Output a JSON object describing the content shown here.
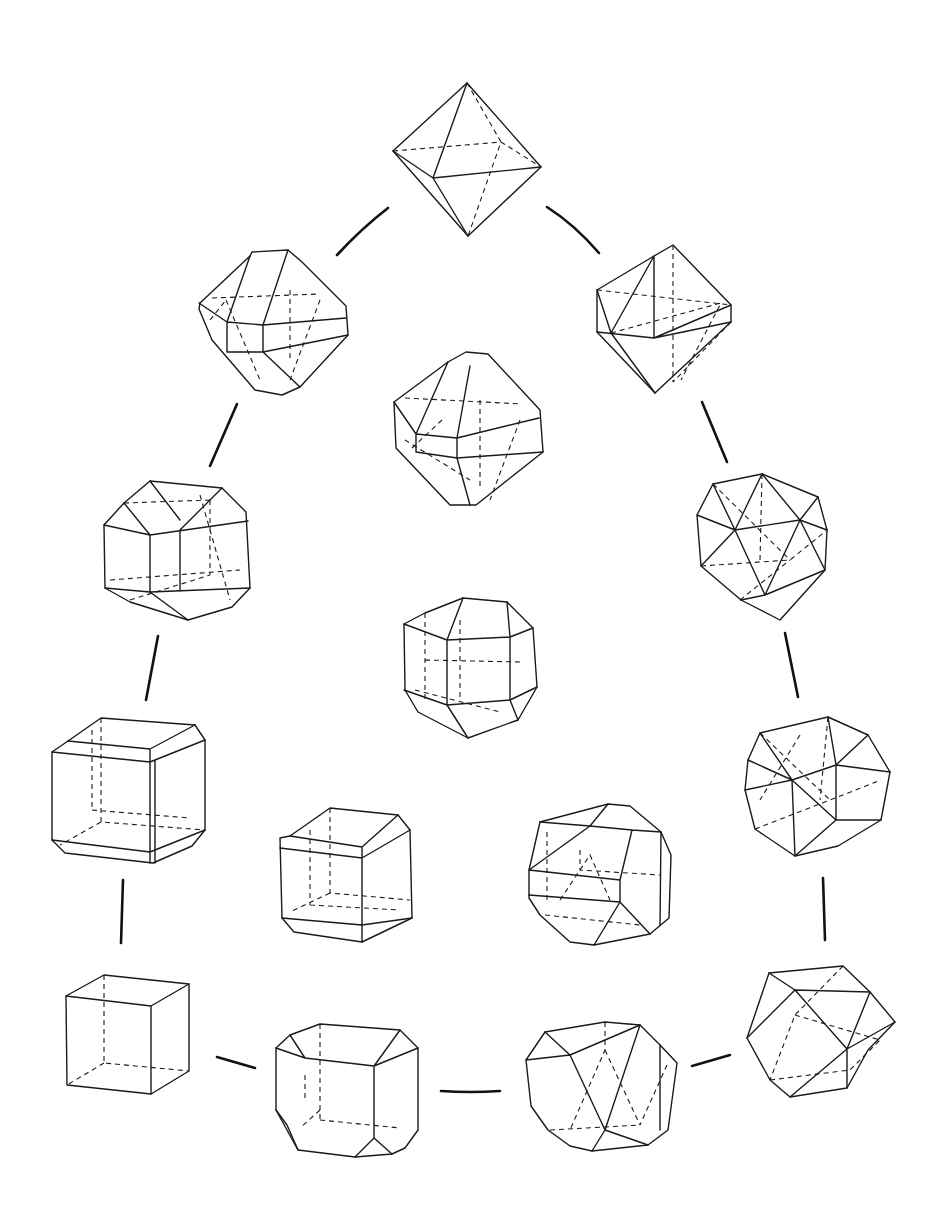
{
  "figure": {
    "background": "#ffffff",
    "line_color": "#1a1a1a",
    "shapes": [
      {
        "id": "octahedron",
        "cx": 467,
        "cy": 160
      },
      {
        "id": "truncated-octahedron-left",
        "cx": 273,
        "cy": 320
      },
      {
        "id": "octahedron-with-cube-faces-right",
        "cx": 663,
        "cy": 320
      },
      {
        "id": "center-upper-form",
        "cx": 468,
        "cy": 428
      },
      {
        "id": "cubo-octahedral-left",
        "cx": 176,
        "cy": 548
      },
      {
        "id": "icosahedral-right",
        "cx": 762,
        "cy": 546
      },
      {
        "id": "center-middle-form",
        "cx": 470,
        "cy": 666
      },
      {
        "id": "chamfered-cube-left",
        "cx": 127,
        "cy": 788
      },
      {
        "id": "cuboctahedral-right",
        "cx": 817,
        "cy": 786
      },
      {
        "id": "truncated-cube-inner-left",
        "cx": 344,
        "cy": 870
      },
      {
        "id": "rounded-form-inner-right",
        "cx": 597,
        "cy": 870
      },
      {
        "id": "cube",
        "cx": 127,
        "cy": 1035
      },
      {
        "id": "truncated-cube-bottom",
        "cx": 346,
        "cy": 1090
      },
      {
        "id": "truncated-form-bottom",
        "cx": 601,
        "cy": 1090
      },
      {
        "id": "cuboctahedron",
        "cx": 820,
        "cy": 1032
      }
    ]
  }
}
